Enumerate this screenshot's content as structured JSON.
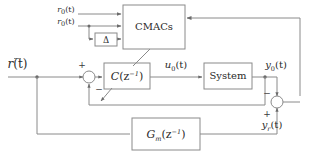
{
  "diagram": {
    "background_color": "#ffffff",
    "line_color": "#8a8a8a",
    "text_color": "#2a2a2a",
    "blocks": [
      {
        "id": "cmacs",
        "label": "CMACs"
      },
      {
        "id": "delta",
        "label": "Δ"
      },
      {
        "id": "controller",
        "label_base": "C",
        "label_arg": "(z",
        "label_exp": "−1",
        "label_close": ")",
        "label_plain": "C(z⁻¹)"
      },
      {
        "id": "system",
        "label": "System"
      },
      {
        "id": "refmodel",
        "label_base": "G",
        "label_sub": "m",
        "label_arg": "(z",
        "label_exp": "−1",
        "label_close": ")",
        "label_plain": "Gₘ(z⁻¹)"
      }
    ],
    "signals": {
      "r0_top": {
        "base": "r",
        "sub": "0",
        "arg": "(t)",
        "plain": "r₀(t)"
      },
      "r0_second": {
        "base": "r",
        "sub": "0",
        "arg": "(t)",
        "plain": "r₀(t)"
      },
      "r_bar": {
        "base": "r",
        "sub": "",
        "arg": "(t)",
        "plain": "r̄(t)",
        "overbar": true
      },
      "u0": {
        "base": "u",
        "sub": "0",
        "arg": "(t)",
        "plain": "u₀(t)"
      },
      "y0": {
        "base": "y",
        "sub": "0",
        "arg": "(t)",
        "plain": "y₀(t)"
      },
      "yr": {
        "base": "y",
        "sub": "r",
        "arg": "(t)",
        "plain": "yᵣ(t)"
      }
    },
    "summing_junctions": [
      {
        "id": "sum-left",
        "sign_top": "+",
        "sign_bottom": "−"
      },
      {
        "id": "sum-right",
        "sign_top": "−",
        "sign_bottom": "+"
      }
    ]
  }
}
